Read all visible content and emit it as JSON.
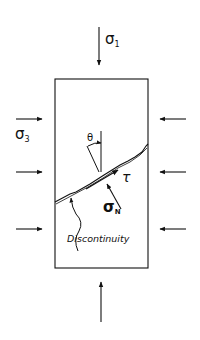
{
  "diagram": {
    "labels": {
      "sigma1": "σ",
      "sigma1_sub": "1",
      "sigma3": "σ",
      "sigma3_sub": "3",
      "sigmaN": "σ",
      "sigmaN_sub": "N",
      "tau": "τ",
      "theta": "θ",
      "discontinuity": "Discontinuity"
    },
    "colors": {
      "line": "#111111",
      "background": "#ffffff"
    }
  }
}
